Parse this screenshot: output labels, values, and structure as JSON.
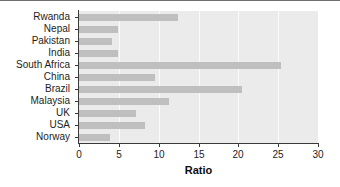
{
  "chart_data": {
    "type": "bar",
    "orientation": "horizontal",
    "title": "",
    "xlabel": "Ratio",
    "ylabel": "",
    "xlim": [
      0,
      30
    ],
    "ylim": null,
    "xticks": [
      0,
      5,
      10,
      15,
      20,
      25,
      30
    ],
    "xticklabels": [
      "0",
      "5",
      "10",
      "15",
      "20",
      "25",
      "30"
    ],
    "grid": "vertical-major-only",
    "legend": "none",
    "categories": [
      "Rwanda",
      "Nepal",
      "Pakistan",
      "India",
      "South Africa",
      "China",
      "Brazil",
      "Malaysia",
      "UK",
      "USA",
      "Norway"
    ],
    "values": [
      12.4,
      4.9,
      4.1,
      4.9,
      25.3,
      9.5,
      20.5,
      11.3,
      7.1,
      8.3,
      3.9
    ],
    "series": [
      {
        "name": "Ratio",
        "values": [
          12.4,
          4.9,
          4.1,
          4.9,
          25.3,
          9.5,
          20.5,
          11.3,
          7.1,
          8.3,
          3.9
        ]
      }
    ],
    "colors": {
      "bar": "#bfbfbf",
      "panel_background": "#ebebeb",
      "gridline": "#fbfbfb",
      "axis": "#3a3a3a",
      "text": "#1d1d1d",
      "figure_background": "#ffffff"
    }
  }
}
